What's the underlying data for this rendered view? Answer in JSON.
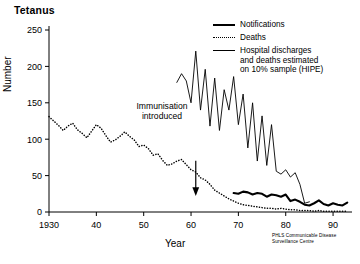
{
  "chart_data": {
    "type": "line",
    "title": "Tetanus",
    "xlabel": "Year",
    "ylabel": "Number",
    "xlim": [
      1930,
      1994
    ],
    "ylim": [
      0,
      250
    ],
    "xticks": [
      1930,
      1940,
      1950,
      1960,
      1970,
      1980,
      1990
    ],
    "xticklabels": [
      "1930",
      "40",
      "50",
      "60",
      "70",
      "80",
      "90"
    ],
    "yticks": [
      0,
      50,
      100,
      150,
      200,
      250
    ],
    "yticklabels": [
      "0",
      "50",
      "100",
      "150",
      "200",
      "250"
    ],
    "grid": false,
    "legend_position": "top-right",
    "annotations": [
      {
        "text": "Immunisation\nintroduced",
        "x": 1961,
        "y": 95,
        "arrow": "down"
      }
    ],
    "credit": "PHLS Communicable Disease\nSurveillance Centre",
    "series": [
      {
        "name": "Notifications",
        "style": "solid-thick",
        "x": [
          1969,
          1970,
          1971,
          1972,
          1973,
          1974,
          1975,
          1976,
          1977,
          1978,
          1979,
          1980,
          1981,
          1982,
          1983,
          1984,
          1985,
          1986,
          1987,
          1988,
          1989,
          1990,
          1991,
          1992,
          1993
        ],
        "values": [
          26,
          25,
          28,
          27,
          24,
          26,
          25,
          21,
          24,
          23,
          21,
          24,
          15,
          17,
          14,
          10,
          9,
          12,
          16,
          11,
          9,
          12,
          10,
          9,
          13
        ]
      },
      {
        "name": "Deaths",
        "style": "dotted",
        "x": [
          1930,
          1931,
          1932,
          1933,
          1934,
          1935,
          1936,
          1937,
          1938,
          1939,
          1940,
          1941,
          1942,
          1943,
          1944,
          1945,
          1946,
          1947,
          1948,
          1949,
          1950,
          1951,
          1952,
          1953,
          1954,
          1955,
          1956,
          1957,
          1958,
          1959,
          1960,
          1961,
          1962,
          1963,
          1964,
          1965,
          1966,
          1967,
          1968,
          1969,
          1970,
          1971,
          1972,
          1973,
          1974,
          1975,
          1976,
          1977,
          1978,
          1979,
          1980,
          1981,
          1982,
          1983,
          1984,
          1985,
          1986,
          1987,
          1988,
          1989,
          1990,
          1991,
          1992,
          1993
        ],
        "values": [
          131,
          125,
          119,
          112,
          118,
          122,
          113,
          108,
          102,
          111,
          120,
          115,
          105,
          96,
          99,
          104,
          110,
          104,
          99,
          90,
          92,
          87,
          78,
          80,
          71,
          64,
          66,
          70,
          72,
          65,
          58,
          55,
          47,
          44,
          38,
          30,
          26,
          22,
          18,
          15,
          12,
          10,
          9,
          8,
          7,
          6,
          5,
          5,
          4,
          5,
          4,
          3,
          3,
          2,
          2,
          2,
          1,
          2,
          1,
          1,
          1,
          1,
          1,
          1
        ]
      },
      {
        "name": "Hospital discharges and deaths estimated on 10% sample (HIPE)",
        "style": "solid-thin",
        "x": [
          1957,
          1958,
          1959,
          1960,
          1961,
          1962,
          1963,
          1964,
          1965,
          1966,
          1967,
          1968,
          1969,
          1970,
          1971,
          1972,
          1973,
          1974,
          1975,
          1976,
          1977,
          1978,
          1979,
          1980,
          1981,
          1982,
          1983,
          1984,
          1985
        ],
        "values": [
          178,
          190,
          180,
          150,
          221,
          140,
          196,
          118,
          184,
          112,
          168,
          140,
          186,
          120,
          162,
          88,
          150,
          70,
          132,
          64,
          120,
          56,
          52,
          58,
          48,
          54,
          38,
          12,
          14
        ]
      }
    ]
  },
  "legend": {
    "items": [
      {
        "label": "Notifications",
        "style": "solid-thick"
      },
      {
        "label": "Deaths",
        "style": "dotted"
      },
      {
        "label": "Hospital discharges\nand deaths estimated\non 10% sample (HIPE)",
        "style": "solid-thin"
      }
    ]
  }
}
